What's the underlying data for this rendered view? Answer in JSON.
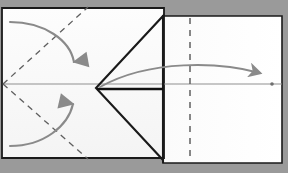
{
  "figure": {
    "type": "origami-folding-diagram",
    "canvas": {
      "width": 288,
      "height": 173
    },
    "colors": {
      "background": "#9a9a9a",
      "paper": "#ffffff",
      "paper_shadow": "#efefef",
      "edge_line": "#1a1a1a",
      "fold_line_valley": "#8c8c8c",
      "crease_dashed": "#6a6a6a",
      "arrow": "#8a8a8a",
      "arrow_dark": "#707070"
    },
    "panels": [
      {
        "name": "left-square-panel",
        "label": "Left square sheet",
        "outline": "0,8 163,8 163,158 0,158"
      },
      {
        "name": "right-rect-panel",
        "label": "Right rectangular sheet",
        "outline": "163,16 281,16 281,163 163,163"
      }
    ],
    "lines": [
      {
        "name": "top-edge-left",
        "kind": "edge",
        "style": "solid-dark",
        "x1": 2,
        "y1": 9,
        "x2": 163,
        "y2": 9
      },
      {
        "name": "bottom-edge-left",
        "kind": "edge",
        "style": "solid-dark",
        "x1": 2,
        "y1": 157,
        "x2": 163,
        "y2": 157
      },
      {
        "name": "left-edge",
        "kind": "edge",
        "style": "solid-dark",
        "x1": 3,
        "y1": 9,
        "x2": 3,
        "y2": 157
      },
      {
        "name": "top-edge-right",
        "kind": "edge",
        "style": "solid-dark",
        "x1": 163,
        "y1": 17,
        "x2": 282,
        "y2": 17
      },
      {
        "name": "bottom-edge-right",
        "kind": "edge",
        "style": "solid-dark",
        "x1": 163,
        "y1": 162,
        "x2": 282,
        "y2": 162
      },
      {
        "name": "vertical-spine",
        "kind": "edge",
        "style": "solid-dark",
        "x1": 163,
        "y1": 16,
        "x2": 163,
        "y2": 163
      },
      {
        "name": "horizontal-centre-fold",
        "kind": "fold",
        "style": "solid-gray",
        "x1": 3,
        "y1": 84,
        "x2": 163,
        "y2": 84
      },
      {
        "name": "horizontal-centre-fold-right",
        "kind": "fold",
        "style": "solid-gray",
        "x1": 163,
        "y1": 84,
        "x2": 282,
        "y2": 84
      },
      {
        "name": "flap-upper-diagonal",
        "kind": "edge",
        "style": "solid-dark",
        "x1": 96,
        "y1": 88,
        "x2": 163,
        "y2": 16
      },
      {
        "name": "flap-lower-diagonal",
        "kind": "edge",
        "style": "solid-dark",
        "x1": 96,
        "y1": 88,
        "x2": 163,
        "y2": 160
      },
      {
        "name": "flap-horizontal-edge",
        "kind": "edge",
        "style": "solid-dark",
        "x1": 96,
        "y1": 89,
        "x2": 163,
        "y2": 89
      },
      {
        "name": "crease-diagonal-upper",
        "kind": "crease",
        "style": "dashed",
        "x1": 3,
        "y1": 84,
        "x2": 87,
        "y2": 8
      },
      {
        "name": "crease-diagonal-lower",
        "kind": "crease",
        "style": "dashed",
        "x1": 3,
        "y1": 84,
        "x2": 87,
        "y2": 158
      },
      {
        "name": "crease-vertical-dashed",
        "kind": "crease",
        "style": "dashed",
        "x1": 190,
        "y1": 19,
        "x2": 190,
        "y2": 160
      }
    ],
    "arrows": [
      {
        "name": "fold-down-arrow",
        "label": "Fold top corner down",
        "path": "M 10,22 C 44,22 70,42 74,62",
        "head_at": [
          74,
          70
        ],
        "direction": "down"
      },
      {
        "name": "fold-up-arrow",
        "label": "Fold bottom corner up",
        "path": "M 10,146 C 44,146 68,126 73,104",
        "head_at": [
          73,
          96
        ],
        "direction": "up"
      },
      {
        "name": "fold-right-arrow",
        "label": "Fold flap to the right",
        "path": "M 100,87 C 150,60 220,62 262,73",
        "head_at": [
          270,
          76
        ],
        "direction": "right"
      }
    ],
    "markers": [
      {
        "name": "reference-dot-right",
        "x": 272,
        "y": 84
      }
    ]
  }
}
